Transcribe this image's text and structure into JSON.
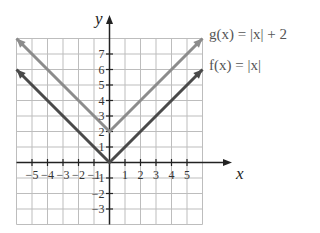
{
  "chart_data": {
    "type": "line",
    "title": "",
    "xlabel": "x",
    "ylabel": "y",
    "xlim": [
      -6,
      6
    ],
    "ylim": [
      -4,
      8
    ],
    "grid": true,
    "x_ticks": [
      -5,
      -4,
      -3,
      -2,
      -1,
      1,
      2,
      3,
      4,
      5
    ],
    "y_ticks": [
      -3,
      -2,
      -1,
      1,
      2,
      3,
      4,
      5,
      6,
      7
    ],
    "x_tick_labels": [
      "−5",
      "−4",
      "−3",
      "−2",
      "−1",
      "1",
      "2",
      "3",
      "4",
      "5"
    ],
    "y_tick_labels": [
      "−3",
      "−2",
      "−1",
      "1",
      "2",
      "3",
      "4",
      "5",
      "6",
      "7"
    ],
    "series": [
      {
        "name": "g(x) = |x| + 2",
        "color": "#8c8c8c",
        "x": [
          -6,
          0,
          6
        ],
        "y": [
          8,
          2,
          8
        ]
      },
      {
        "name": "f(x) = |x|",
        "color": "#4a4a4a",
        "x": [
          -6,
          0,
          6
        ],
        "y": [
          6,
          0,
          6
        ]
      }
    ],
    "legend": [
      {
        "label_prefix": "g",
        "label": "g(x) = |x| + 2",
        "position": "right, aligned with g arrow end"
      },
      {
        "label_prefix": "f",
        "label": "f(x) = |x|",
        "position": "right, aligned with f arrow end"
      }
    ]
  },
  "labels": {
    "x_axis": "x",
    "y_axis": "y",
    "g_label": "g(x) = |x| + 2",
    "f_label": "f(x) = |x|"
  },
  "colors": {
    "grid": "#bdbdbd",
    "axis": "#222222",
    "g_line": "#8c8c8c",
    "f_line": "#4a4a4a"
  }
}
